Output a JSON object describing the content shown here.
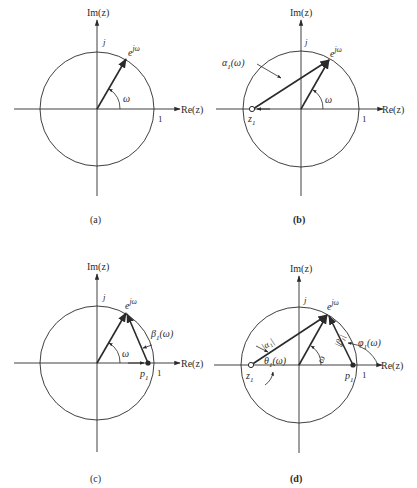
{
  "figure": {
    "panels": [
      {
        "id": "a",
        "caption": "(a)",
        "axis_x_label": "Re(z)",
        "axis_y_label": "Im(z)",
        "tick_j": "j",
        "tick_1": "1",
        "vector_label": "e^{jω}",
        "vector_label_base": "e",
        "vector_label_sup": "jω",
        "angle_label": "ω"
      },
      {
        "id": "b",
        "caption": "(b)",
        "axis_x_label": "Re(z)",
        "axis_y_label": "Im(z)",
        "tick_j": "j",
        "tick_1": "1",
        "vector_label_base": "e",
        "vector_label_sup": "jω",
        "angle_label": "ω",
        "zero_label_base": "z",
        "zero_label_sub": "1",
        "zero_vector_label_base": "α",
        "zero_vector_label_sub": "1",
        "zero_vector_label_arg": "(ω)"
      },
      {
        "id": "c",
        "caption": "(c)",
        "axis_x_label": "Re(z)",
        "axis_y_label": "Im(z)",
        "tick_j": "j",
        "tick_1": "1",
        "vector_label_base": "e",
        "vector_label_sup": "jω",
        "angle_label": "ω",
        "pole_label_base": "p",
        "pole_label_sub": "1",
        "pole_vector_label_base": "β",
        "pole_vector_label_sub": "1",
        "pole_vector_label_arg": "(ω)"
      },
      {
        "id": "d",
        "caption": "(d)",
        "axis_x_label": "Re(z)",
        "axis_y_label": "Im(z)",
        "tick_j": "j",
        "tick_1": "1",
        "vector_label_base": "e",
        "vector_label_sup": "jω",
        "angle_label": "ω",
        "zero_label_base": "z",
        "zero_label_sub": "1",
        "pole_label_base": "p",
        "pole_label_sub": "1",
        "zero_mag_label": "|α₁|",
        "pole_mag_label": "|β₁|",
        "zero_angle_label_base": "θ",
        "zero_angle_label_sub": "1",
        "zero_angle_label_arg": "(ω)",
        "pole_angle_label_base": "φ",
        "pole_angle_label_sub": "1",
        "pole_angle_label_arg": "(ω)"
      }
    ],
    "colors": {
      "ink": "#2a2a2a",
      "background": "#ffffff"
    }
  }
}
